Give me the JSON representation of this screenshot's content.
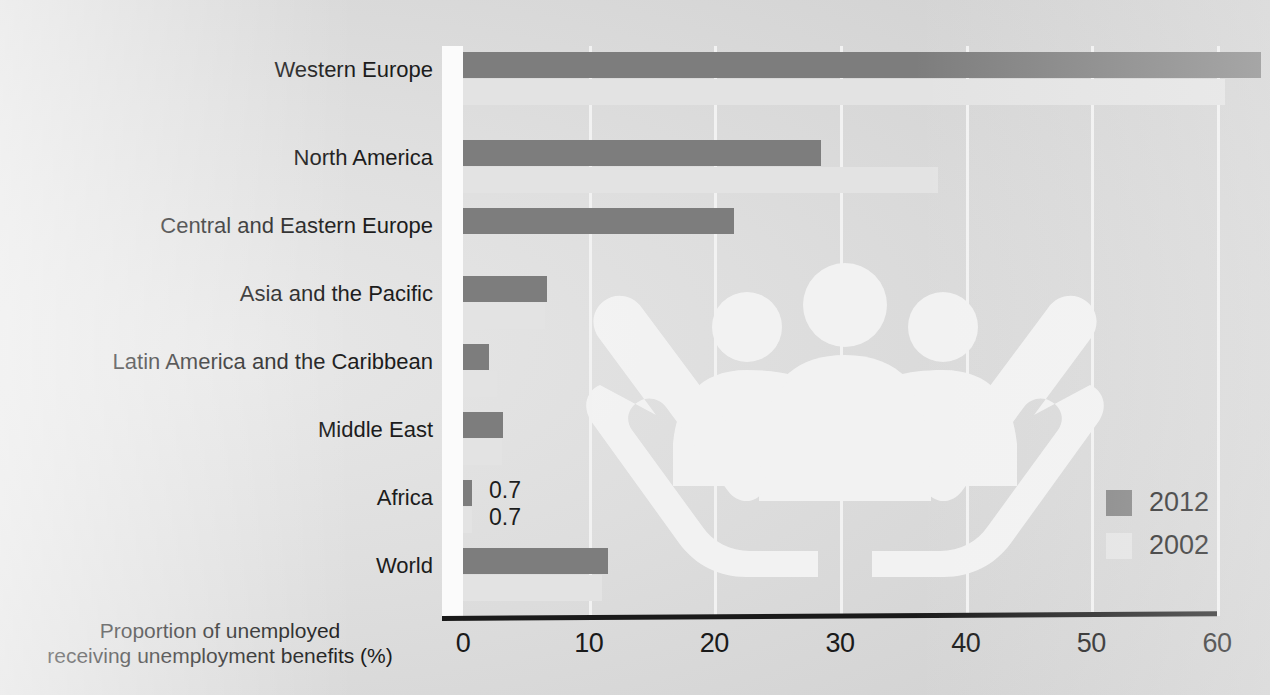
{
  "chart_data": {
    "type": "bar",
    "orientation": "horizontal",
    "title": "",
    "xlabel": "Proportion of unemployed receiving unemployment benefits (%)",
    "ylabel": "",
    "xlim": [
      0,
      60
    ],
    "xticks": [
      0,
      10,
      20,
      30,
      40,
      50,
      60
    ],
    "xtick_labels": [
      "0",
      "10",
      "20",
      "30",
      "40",
      "50",
      "60"
    ],
    "grid": true,
    "grid_axis": "x",
    "legend_position": "bottom-right",
    "categories": [
      "Western Europe",
      "North America",
      "Central and Eastern Europe",
      "Asia and the Pacific",
      "Latin America and the Caribbean",
      "Middle East",
      "Africa",
      "World"
    ],
    "series": [
      {
        "name": "2012",
        "color": "#7d7d7d",
        "values": [
          63.5,
          28.5,
          21.6,
          6.7,
          2.1,
          3.2,
          0.7,
          11.5
        ]
      },
      {
        "name": "2002",
        "color": "#e3e3e3",
        "values": [
          60.6,
          37.8,
          0.0,
          6.5,
          2.7,
          3.1,
          0.7,
          11.1
        ]
      }
    ],
    "point_labels": [
      {
        "category": "Africa",
        "series": "2012",
        "text": "0.7"
      },
      {
        "category": "Africa",
        "series": "2002",
        "text": "0.7"
      }
    ]
  },
  "axis_title": {
    "line1": "Proportion of unemployed",
    "line2": "receiving unemployment benefits (%)"
  },
  "legend": {
    "items": [
      {
        "label": "2012",
        "color": "#7d7d7d"
      },
      {
        "label": "2002",
        "color": "#e3e3e3"
      }
    ]
  },
  "colors": {
    "series_2012": "#7d7d7d",
    "series_2002": "#e3e3e3",
    "axis": "#1a1a1a",
    "gridline": "#f2f2f2",
    "background": "#d9d9d9",
    "text": "#1c1c1c"
  },
  "watermark": {
    "name": "people-in-hands-illustration",
    "color": "#f3f3f3"
  }
}
